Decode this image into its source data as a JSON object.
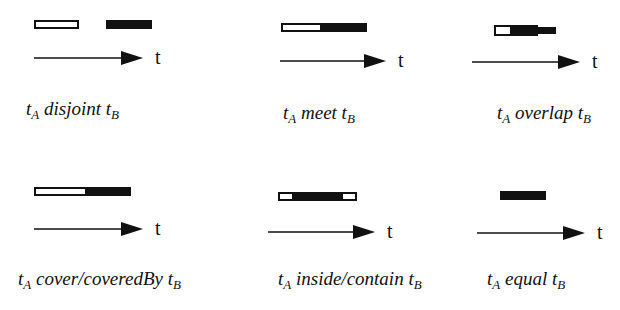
{
  "axis_label": "t",
  "colors": {
    "ink": "#111111",
    "paper": "#ffffff"
  },
  "panels": [
    {
      "id": "disjoint",
      "relation": "disjoint",
      "caption": {
        "lhs": "t",
        "lhs_sub": "A",
        "relation": "disjoint",
        "rhs": "t",
        "rhs_sub": "B"
      },
      "bars": [
        {
          "type": "hollow",
          "x": 34,
          "y": 20,
          "w": 45,
          "h": 9
        },
        {
          "type": "solid",
          "x": 106,
          "y": 20,
          "w": 46,
          "h": 9
        }
      ],
      "arrow": {
        "x1": 34,
        "x2": 143,
        "y": 58
      },
      "tlabel": {
        "x": 155,
        "y": 46
      },
      "caption_pos": {
        "x": 26,
        "y": 98
      }
    },
    {
      "id": "meet",
      "relation": "meet",
      "caption": {
        "lhs": "t",
        "lhs_sub": "A",
        "relation": "meet",
        "rhs": "t",
        "rhs_sub": "B"
      },
      "bars": [
        {
          "type": "hollow",
          "x": 281,
          "y": 23,
          "w": 41,
          "h": 9
        },
        {
          "type": "solid",
          "x": 322,
          "y": 23,
          "w": 45,
          "h": 9
        }
      ],
      "arrow": {
        "x1": 280,
        "x2": 386,
        "y": 61
      },
      "tlabel": {
        "x": 398,
        "y": 49
      },
      "caption_pos": {
        "x": 283,
        "y": 102
      }
    },
    {
      "id": "overlap",
      "relation": "overlap",
      "caption": {
        "lhs": "t",
        "lhs_sub": "A",
        "relation": "overlap",
        "rhs": "t",
        "rhs_sub": "B"
      },
      "bars": [
        {
          "type": "hollow",
          "x": 494,
          "y": 25,
          "w": 18,
          "h": 11
        },
        {
          "type": "solid",
          "x": 512,
          "y": 25,
          "w": 26,
          "h": 11
        },
        {
          "type": "solid",
          "x": 538,
          "y": 27,
          "w": 18,
          "h": 7
        }
      ],
      "arrow": {
        "x1": 472,
        "x2": 580,
        "y": 62
      },
      "tlabel": {
        "x": 592,
        "y": 50
      },
      "caption_pos": {
        "x": 497,
        "y": 102
      }
    },
    {
      "id": "cover",
      "relation": "cover/coveredBy",
      "caption": {
        "lhs": "t",
        "lhs_sub": "A",
        "relation": "cover/coveredBy",
        "rhs": "t",
        "rhs_sub": "B"
      },
      "bars": [
        {
          "type": "hollow",
          "x": 34,
          "y": 187,
          "w": 53,
          "h": 9
        },
        {
          "type": "solid",
          "x": 87,
          "y": 187,
          "w": 44,
          "h": 9
        }
      ],
      "arrow": {
        "x1": 34,
        "x2": 143,
        "y": 229
      },
      "tlabel": {
        "x": 155,
        "y": 217
      },
      "caption_pos": {
        "x": 18,
        "y": 268
      }
    },
    {
      "id": "inside",
      "relation": "inside/contain",
      "caption": {
        "lhs": "t",
        "lhs_sub": "A",
        "relation": "inside/contain",
        "rhs": "t",
        "rhs_sub": "B"
      },
      "bars": [
        {
          "type": "hollow",
          "x": 278,
          "y": 192,
          "w": 16,
          "h": 9
        },
        {
          "type": "solid",
          "x": 294,
          "y": 192,
          "w": 47,
          "h": 9
        },
        {
          "type": "hollow",
          "x": 341,
          "y": 192,
          "w": 16,
          "h": 9
        }
      ],
      "arrow": {
        "x1": 268,
        "x2": 375,
        "y": 232
      },
      "tlabel": {
        "x": 387,
        "y": 220
      },
      "caption_pos": {
        "x": 278,
        "y": 268
      }
    },
    {
      "id": "equal",
      "relation": "equal",
      "caption": {
        "lhs": "t",
        "lhs_sub": "A",
        "relation": "equal",
        "rhs": "t",
        "rhs_sub": "B"
      },
      "bars": [
        {
          "type": "solid",
          "x": 500,
          "y": 191,
          "w": 46,
          "h": 9
        }
      ],
      "arrow": {
        "x1": 477,
        "x2": 585,
        "y": 233
      },
      "tlabel": {
        "x": 597,
        "y": 221
      },
      "caption_pos": {
        "x": 487,
        "y": 268
      }
    }
  ]
}
